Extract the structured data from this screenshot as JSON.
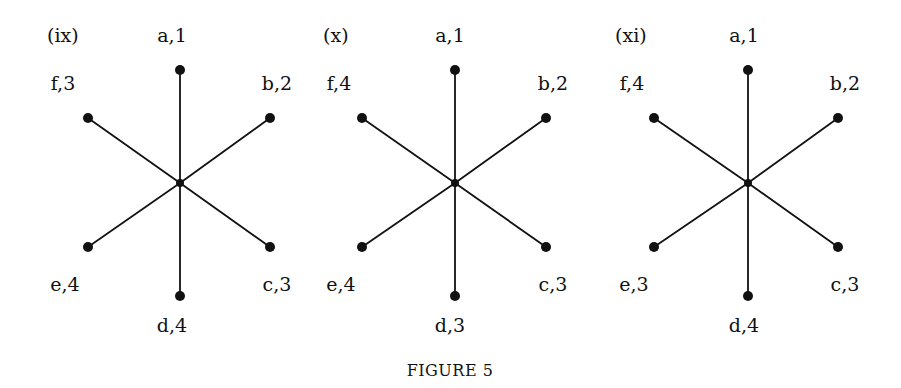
{
  "figure": {
    "caption": "FIGURE 5",
    "colors": {
      "ink": "#111111",
      "background": "#ffffff"
    }
  },
  "panels": [
    {
      "label": "(ix)",
      "center": [
        180,
        183
      ],
      "nodes": {
        "a": {
          "text": "a,1",
          "pos": [
            180,
            70
          ],
          "label_pos": [
            172,
            35
          ]
        },
        "b": {
          "text": "b,2",
          "pos": [
            270,
            118
          ],
          "label_pos": [
            277,
            83
          ]
        },
        "c": {
          "text": "c,3",
          "pos": [
            270,
            247
          ],
          "label_pos": [
            277,
            284
          ]
        },
        "d": {
          "text": "d,4",
          "pos": [
            180,
            296
          ],
          "label_pos": [
            172,
            325
          ]
        },
        "e": {
          "text": "e,4",
          "pos": [
            88,
            247
          ],
          "label_pos": [
            65,
            284
          ]
        },
        "f": {
          "text": "f,3",
          "pos": [
            88,
            118
          ],
          "label_pos": [
            63,
            83
          ]
        }
      },
      "label_pos": [
        47,
        35
      ]
    },
    {
      "label": "(x)",
      "center": [
        455,
        183
      ],
      "nodes": {
        "a": {
          "text": "a,1",
          "pos": [
            455,
            70
          ],
          "label_pos": [
            450,
            35
          ]
        },
        "b": {
          "text": "b,2",
          "pos": [
            546,
            118
          ],
          "label_pos": [
            553,
            83
          ]
        },
        "c": {
          "text": "c,3",
          "pos": [
            546,
            247
          ],
          "label_pos": [
            553,
            284
          ]
        },
        "d": {
          "text": "d,3",
          "pos": [
            455,
            296
          ],
          "label_pos": [
            450,
            325
          ]
        },
        "e": {
          "text": "e,4",
          "pos": [
            362,
            247
          ],
          "label_pos": [
            341,
            284
          ]
        },
        "f": {
          "text": "f,4",
          "pos": [
            362,
            118
          ],
          "label_pos": [
            339,
            83
          ]
        }
      },
      "label_pos": [
        323,
        35
      ]
    },
    {
      "label": "(xi)",
      "center": [
        748,
        183
      ],
      "nodes": {
        "a": {
          "text": "a,1",
          "pos": [
            748,
            70
          ],
          "label_pos": [
            744,
            35
          ]
        },
        "b": {
          "text": "b,2",
          "pos": [
            838,
            118
          ],
          "label_pos": [
            845,
            83
          ]
        },
        "c": {
          "text": "c,3",
          "pos": [
            838,
            247
          ],
          "label_pos": [
            845,
            284
          ]
        },
        "d": {
          "text": "d,4",
          "pos": [
            748,
            296
          ],
          "label_pos": [
            744,
            325
          ]
        },
        "e": {
          "text": "e,3",
          "pos": [
            654,
            247
          ],
          "label_pos": [
            634,
            284
          ]
        },
        "f": {
          "text": "f,4",
          "pos": [
            654,
            118
          ],
          "label_pos": [
            632,
            83
          ]
        }
      },
      "label_pos": [
        615,
        35
      ]
    }
  ]
}
